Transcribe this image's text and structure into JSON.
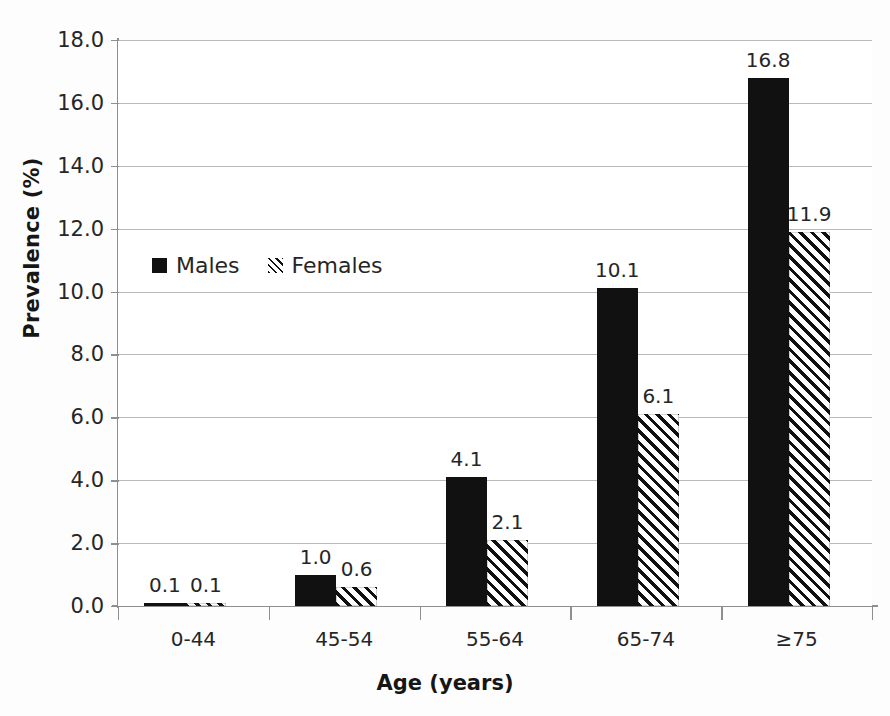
{
  "chart_data": {
    "type": "bar",
    "title": "",
    "xlabel": "Age (years)",
    "ylabel": "Prevalence (%)",
    "categories": [
      "0-44",
      "45-54",
      "55-64",
      "65-74",
      "≥75"
    ],
    "series": [
      {
        "name": "Males",
        "values": [
          0.1,
          1.0,
          4.1,
          10.1,
          16.8
        ]
      },
      {
        "name": "Females",
        "values": [
          0.1,
          0.6,
          2.1,
          6.1,
          11.9
        ]
      }
    ],
    "value_labels": {
      "males": [
        "0.1",
        "1.0",
        "4.1",
        "10.1",
        "16.8"
      ],
      "females": [
        "0.1",
        "0.6",
        "2.1",
        "6.1",
        "11.9"
      ]
    },
    "ylim": [
      0.0,
      18.0
    ],
    "yticks": [
      "0.0",
      "2.0",
      "4.0",
      "6.0",
      "8.0",
      "10.0",
      "12.0",
      "14.0",
      "16.0",
      "18.0"
    ],
    "ytick_values": [
      0.0,
      2.0,
      4.0,
      6.0,
      8.0,
      10.0,
      12.0,
      14.0,
      16.0,
      18.0
    ],
    "grid": true,
    "legend_position": "inside-upper-left",
    "colors": {
      "males": "#111111",
      "females_hatch": "#111111",
      "females_fill": "#ffffff",
      "gridline": "#b9b9b9",
      "axis": "#8f8f8f",
      "text": "#262626",
      "background": "#ffffff"
    }
  },
  "legend": {
    "entries": [
      {
        "label": "Males",
        "marker": "filled-square-marker"
      },
      {
        "label": "Females",
        "marker": "hatched-square-marker"
      }
    ]
  },
  "axes": {
    "y_title": "Prevalence (%)",
    "x_title": "Age (years)"
  }
}
